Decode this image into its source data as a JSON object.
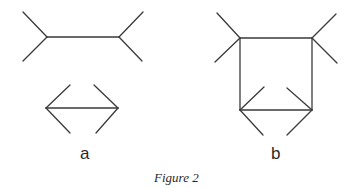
{
  "figure": {
    "caption": "Figure 2",
    "stroke_color": "#3a3a3a",
    "panels": [
      {
        "label": "a",
        "shapes": [
          {
            "name": "fins-outward-line",
            "shaft": [
              [
                47,
                37
              ],
              [
                119,
                37
              ]
            ],
            "fins": [
              [
                [
                  47,
                  37
                ],
                [
                  23,
                  12
                ]
              ],
              [
                [
                  47,
                  37
                ],
                [
                  23,
                  61
                ]
              ],
              [
                [
                  119,
                  37
                ],
                [
                  143,
                  12
                ]
              ],
              [
                [
                  119,
                  37
                ],
                [
                  142,
                  61
                ]
              ]
            ]
          },
          {
            "name": "fins-inward-line",
            "shaft": [
              [
                46,
                108
              ],
              [
                118,
                108
              ]
            ],
            "fins": [
              [
                [
                  46,
                  108
                ],
                [
                  70,
                  85
                ]
              ],
              [
                [
                  46,
                  108
                ],
                [
                  70,
                  133
                ]
              ],
              [
                [
                  118,
                  108
                ],
                [
                  94,
                  85
                ]
              ],
              [
                [
                  118,
                  108
                ],
                [
                  96,
                  133
                ]
              ]
            ]
          }
        ]
      },
      {
        "label": "b",
        "shapes": [
          {
            "name": "fins-outward-line",
            "shaft": [
              [
                240,
                38
              ],
              [
                312,
                38
              ]
            ],
            "fins": [
              [
                [
                  240,
                  38
                ],
                [
                  217,
                  13
                ]
              ],
              [
                [
                  240,
                  38
                ],
                [
                  215,
                  62
                ]
              ],
              [
                [
                  312,
                  38
                ],
                [
                  336,
                  14
                ]
              ],
              [
                [
                  312,
                  38
                ],
                [
                  337,
                  63
                ]
              ]
            ]
          },
          {
            "name": "fins-inward-line",
            "shaft": [
              [
                240,
                110
              ],
              [
                312,
                110
              ]
            ],
            "fins": [
              [
                [
                  240,
                  110
                ],
                [
                  264,
                  87
                ]
              ],
              [
                [
                  240,
                  110
                ],
                [
                  263,
                  135
                ]
              ],
              [
                [
                  312,
                  110
                ],
                [
                  287,
                  88
                ]
              ],
              [
                [
                  312,
                  110
                ],
                [
                  287,
                  135
                ]
              ]
            ]
          },
          {
            "name": "connector-verticals",
            "lines": [
              [
                [
                  240,
                  38
                ],
                [
                  240,
                  110
                ]
              ],
              [
                [
                  312,
                  38
                ],
                [
                  312,
                  110
                ]
              ]
            ]
          }
        ]
      }
    ]
  }
}
